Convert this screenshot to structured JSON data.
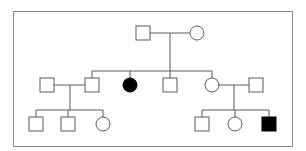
{
  "diagram": {
    "type": "pedigree",
    "title": "",
    "frame": {
      "x": 13,
      "y": 11,
      "width": 280,
      "height": 136,
      "border_color": "#8a8a8a"
    },
    "colors": {
      "line": "#5a5a5a",
      "unaffected_fill": "#ffffff",
      "affected_fill": "#000000"
    },
    "symbol_size": 14,
    "legend": {
      "square": "male",
      "circle": "female",
      "filled": "affected",
      "open": "unaffected"
    },
    "generations": [
      {
        "id": "I",
        "individuals": [
          {
            "id": "I-1",
            "sex": "male",
            "affected": false,
            "cx": 143,
            "cy": 33
          },
          {
            "id": "I-2",
            "sex": "female",
            "affected": false,
            "cx": 197,
            "cy": 33
          }
        ]
      },
      {
        "id": "II",
        "individuals": [
          {
            "id": "II-1",
            "sex": "male",
            "affected": false,
            "cx": 47,
            "cy": 85,
            "note": "spouse (married in)"
          },
          {
            "id": "II-2",
            "sex": "male",
            "affected": false,
            "cx": 92,
            "cy": 85
          },
          {
            "id": "II-3",
            "sex": "female",
            "affected": true,
            "cx": 130,
            "cy": 85
          },
          {
            "id": "II-4",
            "sex": "male",
            "affected": false,
            "cx": 170,
            "cy": 85
          },
          {
            "id": "II-5",
            "sex": "female",
            "affected": false,
            "cx": 212,
            "cy": 85
          },
          {
            "id": "II-6",
            "sex": "male",
            "affected": false,
            "cx": 256,
            "cy": 85,
            "note": "spouse (married in)"
          }
        ]
      },
      {
        "id": "III",
        "individuals": [
          {
            "id": "III-1",
            "sex": "male",
            "affected": false,
            "cx": 36,
            "cy": 124
          },
          {
            "id": "III-2",
            "sex": "male",
            "affected": false,
            "cx": 68,
            "cy": 124
          },
          {
            "id": "III-3",
            "sex": "female",
            "affected": false,
            "cx": 103,
            "cy": 124
          },
          {
            "id": "III-4",
            "sex": "male",
            "affected": false,
            "cx": 202,
            "cy": 124
          },
          {
            "id": "III-5",
            "sex": "female",
            "affected": false,
            "cx": 235,
            "cy": 124
          },
          {
            "id": "III-6",
            "sex": "male",
            "affected": true,
            "cx": 269,
            "cy": 124
          }
        ]
      }
    ],
    "matings": [
      {
        "partners": [
          "I-1",
          "I-2"
        ],
        "children": [
          "II-2",
          "II-3",
          "II-4",
          "II-5"
        ]
      },
      {
        "partners": [
          "II-1",
          "II-2"
        ],
        "children": [
          "III-1",
          "III-2",
          "III-3"
        ]
      },
      {
        "partners": [
          "II-5",
          "II-6"
        ],
        "children": [
          "III-4",
          "III-5",
          "III-6"
        ]
      }
    ],
    "summary": {
      "total_individuals": 14,
      "affected_count": 2,
      "affected_ids": [
        "II-3",
        "III-6"
      ]
    }
  }
}
